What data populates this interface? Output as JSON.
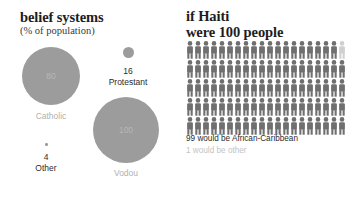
{
  "colors": {
    "background": "#ffffff",
    "bubble_fill": "#9c9c9c",
    "bubble_label": "#b1b1b1",
    "figure_dark": "#6f6f6f",
    "figure_light": "#cfcfcf",
    "text_dark": "#1d1d1d",
    "text_muted": "#c4c4c4"
  },
  "left_panel": {
    "title": "belief systems",
    "subtitle": "(% of population)"
  },
  "right_panel": {
    "title": "if Haiti\nwere 100 people",
    "caption_main": "99 would be African-Caribbean",
    "caption_sub": "1 would be other"
  },
  "chart_data": [
    {
      "type": "bubble",
      "title": "belief systems",
      "subtitle": "(% of population)",
      "unit": "% of population",
      "categories": [
        "Catholic",
        "Protestant",
        "Vodou",
        "Other"
      ],
      "values": [
        80,
        16,
        100,
        4
      ],
      "labels": {
        "catholic_value": "80",
        "catholic_label": "Catholic",
        "protestant_value": "16",
        "protestant_label": "Protestant",
        "vodou_value": "100",
        "vodou_label": "Vodou",
        "other_value": "4",
        "other_label": "Other"
      },
      "note": "Values sum above 100 because Vodou practice overlaps with Christian affiliation",
      "legend": "none",
      "grid": false
    },
    {
      "type": "pictogram",
      "title": "if Haiti were 100 people",
      "total_units": 100,
      "unit_glyph": "person-figure",
      "columns": 20,
      "rows": 5,
      "categories": [
        "African-Caribbean",
        "other"
      ],
      "values": [
        99,
        1
      ],
      "series": [
        {
          "name": "African-Caribbean",
          "values": [
            99
          ],
          "color": "#6f6f6f"
        },
        {
          "name": "other",
          "values": [
            1
          ],
          "color": "#cfcfcf"
        }
      ],
      "annotations": [
        "99 would be African-Caribbean",
        "1 would be other"
      ],
      "legend": "none",
      "grid": false
    }
  ]
}
